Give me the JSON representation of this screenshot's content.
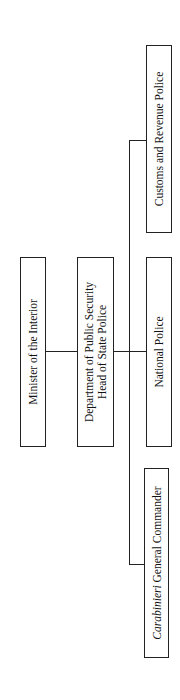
{
  "diagram": {
    "type": "org-chart",
    "orientation": "rotated-90-ccw",
    "nodes": {
      "minister": {
        "label": "Minister of the Interior"
      },
      "department": {
        "line1": "Department of Public Security",
        "line2": "Head of State Police"
      },
      "national_police": {
        "label": "National Police"
      },
      "customs": {
        "label": "Customs and Revenue Police"
      },
      "carabinieri": {
        "italic": "Carabinieri",
        "rest": " General Commander"
      }
    },
    "edges": [
      [
        "minister",
        "department"
      ],
      [
        "department",
        "national_police"
      ],
      [
        "department",
        "customs"
      ],
      [
        "department",
        "carabinieri"
      ]
    ]
  }
}
